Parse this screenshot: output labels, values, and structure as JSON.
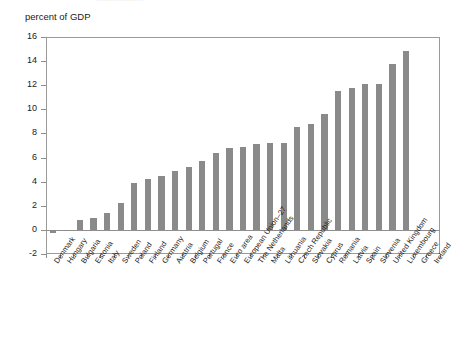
{
  "header": {
    "cropped_top_text": "······················"
  },
  "chart_data": {
    "type": "bar",
    "title": "",
    "subtitle": "",
    "xlabel": "",
    "ylabel": "percent of GDP",
    "ylim": [
      -2,
      16
    ],
    "ytick_values": [
      16,
      14,
      12,
      10,
      8,
      6,
      4,
      2,
      0,
      -2
    ],
    "ytick_labels": [
      "16",
      "14",
      "12",
      "10",
      "8",
      "6",
      "4",
      "2",
      "0",
      "-2"
    ],
    "grid": false,
    "legend": null,
    "bar_color": "#8a8a8a",
    "axis_color": "#8f8f8f",
    "categories": [
      "Denmark",
      "Hungary",
      "Bulgaria",
      "Estonia",
      "Italy",
      "Sweden",
      "Poland",
      "Finland",
      "Germany",
      "Austria",
      "Belgium",
      "Portugal",
      "France",
      "Euro area",
      "European Union–27",
      "The Netherlands",
      "Malta",
      "Lithuania",
      "Czech Republic",
      "Slovakia",
      "Cyprus",
      "Romania",
      "Latvia",
      "Spain",
      "Slovenia",
      "United Kingdom",
      "Luxembourg",
      "Greece",
      "Ireland"
    ],
    "values": [
      -0.3,
      -0.1,
      0.8,
      1.0,
      1.4,
      2.2,
      3.9,
      4.2,
      4.5,
      4.9,
      5.2,
      5.7,
      6.4,
      6.8,
      6.9,
      7.1,
      7.2,
      7.2,
      8.5,
      8.8,
      9.6,
      11.5,
      11.8,
      12.1,
      12.1,
      13.8,
      14.8,
      0,
      0
    ]
  }
}
